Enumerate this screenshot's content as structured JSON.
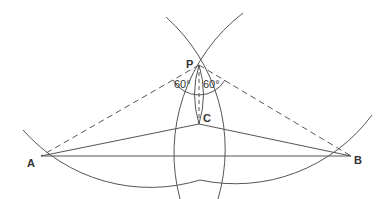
{
  "diagram": {
    "title": "",
    "points": {
      "A": {
        "label": "A",
        "x": 41,
        "y": 156
      },
      "B": {
        "label": "B",
        "x": 351,
        "y": 156
      },
      "P": {
        "label": "P",
        "x": 199,
        "y": 65
      },
      "C": {
        "label": "C",
        "x": 199,
        "y": 124
      }
    },
    "angles": {
      "left": {
        "label": "60°"
      },
      "right": {
        "label": "60°"
      }
    },
    "line_color": "#555555"
  }
}
